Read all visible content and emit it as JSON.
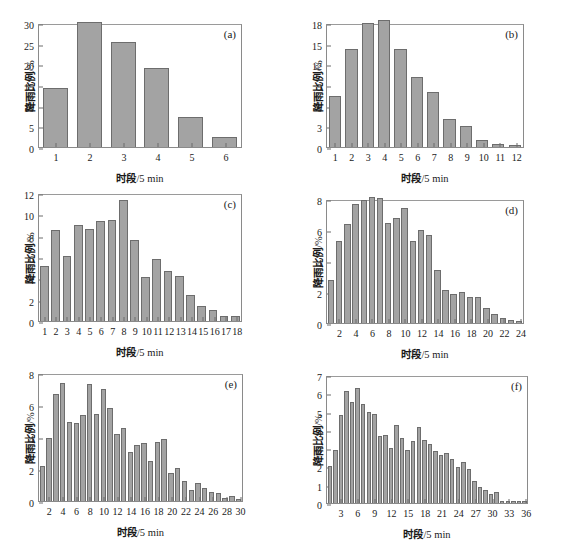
{
  "figure": {
    "bar_fill": "#a3a3a3",
    "bar_stroke": "#6d6d6d",
    "axis_color": "#8a8a8a",
    "background": "#ffffff",
    "ylabel_text": "降雨比例",
    "ylabel_unit": "/%",
    "xlabel_text": "时段",
    "xlabel_unit": "/5 min"
  },
  "chart_data": [
    {
      "type": "bar",
      "panel": "(a)",
      "title": "",
      "xlabel": "时段/5 min",
      "ylabel": "降雨比例/%",
      "ylim": [
        0,
        30
      ],
      "yticks": [
        0,
        5,
        10,
        15,
        20,
        25,
        30
      ],
      "grid": false,
      "categories": [
        "1",
        "2",
        "3",
        "4",
        "5",
        "6"
      ],
      "xtick_labels": [
        "1",
        "2",
        "3",
        "4",
        "5",
        "6"
      ],
      "values": [
        14.3,
        30.3,
        25.4,
        19.0,
        7.3,
        2.5
      ]
    },
    {
      "type": "bar",
      "panel": "(b)",
      "title": "",
      "xlabel": "时段/5 min",
      "ylabel": "降雨比例/%",
      "ylim": [
        0,
        18
      ],
      "yticks": [
        0,
        3,
        6,
        9,
        12,
        15,
        18
      ],
      "grid": false,
      "categories": [
        "1",
        "2",
        "3",
        "4",
        "5",
        "6",
        "7",
        "8",
        "9",
        "10",
        "11",
        "12"
      ],
      "xtick_labels": [
        "1",
        "2",
        "3",
        "4",
        "5",
        "6",
        "7",
        "8",
        "9",
        "10",
        "11",
        "12"
      ],
      "values": [
        7.4,
        14.2,
        18.0,
        18.4,
        14.2,
        10.1,
        8.0,
        4.1,
        3.0,
        1.0,
        0.4,
        0.3
      ]
    },
    {
      "type": "bar",
      "panel": "(c)",
      "title": "",
      "xlabel": "时段/5 min",
      "ylabel": "降雨比例/%",
      "ylim": [
        0,
        12
      ],
      "yticks": [
        0,
        2,
        4,
        6,
        8,
        10,
        12
      ],
      "grid": false,
      "categories": [
        "1",
        "2",
        "3",
        "4",
        "5",
        "6",
        "7",
        "8",
        "9",
        "10",
        "11",
        "12",
        "13",
        "14",
        "15",
        "16",
        "17",
        "18"
      ],
      "xtick_labels": [
        "1",
        "2",
        "3",
        "4",
        "5",
        "6",
        "7",
        "8",
        "9",
        "10",
        "11",
        "12",
        "13",
        "14",
        "15",
        "16",
        "17",
        "18"
      ],
      "values": [
        5.2,
        8.5,
        6.1,
        9.0,
        8.65,
        9.35,
        9.45,
        11.35,
        7.6,
        4.1,
        5.8,
        4.7,
        4.25,
        2.45,
        1.4,
        1.05,
        0.5,
        0.5
      ]
    },
    {
      "type": "bar",
      "panel": "(d)",
      "title": "",
      "xlabel": "时段/5 min",
      "ylabel": "降雨比例/%",
      "ylim": [
        0,
        8
      ],
      "yticks": [
        0,
        2,
        4,
        6,
        8
      ],
      "grid": false,
      "categories": [
        "1",
        "2",
        "3",
        "4",
        "5",
        "6",
        "7",
        "8",
        "9",
        "10",
        "11",
        "12",
        "13",
        "14",
        "15",
        "16",
        "17",
        "18",
        "19",
        "20",
        "21",
        "22",
        "23",
        "24"
      ],
      "xtick_labels": [
        "2",
        "4",
        "6",
        "8",
        "10",
        "12",
        "14",
        "16",
        "18",
        "20",
        "22",
        "24"
      ],
      "xtick_every": 2,
      "values": [
        2.8,
        5.3,
        6.4,
        7.65,
        7.95,
        8.1,
        8.05,
        6.45,
        6.8,
        7.45,
        5.3,
        6.0,
        5.7,
        3.4,
        2.1,
        1.85,
        2.0,
        1.7,
        1.7,
        1.0,
        0.6,
        0.3,
        0.2,
        0.12
      ]
    },
    {
      "type": "bar",
      "panel": "(e)",
      "title": "",
      "xlabel": "时段/5 min",
      "ylabel": "降雨比例/%",
      "ylim": [
        0,
        8
      ],
      "yticks": [
        0,
        2,
        4,
        6,
        8
      ],
      "grid": false,
      "categories": [
        "1",
        "2",
        "3",
        "4",
        "5",
        "6",
        "7",
        "8",
        "9",
        "10",
        "11",
        "12",
        "13",
        "14",
        "15",
        "16",
        "17",
        "18",
        "19",
        "20",
        "21",
        "22",
        "23",
        "24",
        "25",
        "26",
        "27",
        "28",
        "29",
        "30"
      ],
      "xtick_labels": [
        "2",
        "4",
        "6",
        "8",
        "10",
        "12",
        "14",
        "16",
        "18",
        "20",
        "22",
        "24",
        "26",
        "28",
        "30"
      ],
      "xtick_every": 2,
      "values": [
        2.2,
        3.95,
        6.7,
        7.4,
        4.95,
        4.85,
        5.35,
        7.3,
        5.45,
        7.0,
        5.8,
        4.2,
        4.55,
        3.05,
        3.5,
        3.62,
        2.48,
        3.68,
        3.9,
        1.75,
        2.05,
        1.25,
        0.7,
        1.15,
        0.8,
        0.55,
        0.48,
        0.18,
        0.3,
        0.15
      ]
    },
    {
      "type": "bar",
      "panel": "(f)",
      "title": "",
      "xlabel": "时段/5 min",
      "ylabel": "降雨比例/%",
      "ylim": [
        0,
        7
      ],
      "yticks": [
        0,
        1,
        2,
        3,
        4,
        5,
        6,
        7
      ],
      "grid": false,
      "categories": [
        "1",
        "2",
        "3",
        "4",
        "5",
        "6",
        "7",
        "8",
        "9",
        "10",
        "11",
        "12",
        "13",
        "14",
        "15",
        "16",
        "17",
        "18",
        "19",
        "20",
        "21",
        "22",
        "23",
        "24",
        "25",
        "26",
        "27",
        "28",
        "29",
        "30",
        "31",
        "32",
        "33",
        "34",
        "35",
        "36"
      ],
      "xtick_labels": [
        "3",
        "6",
        "9",
        "12",
        "15",
        "18",
        "21",
        "24",
        "27",
        "30",
        "33",
        "36"
      ],
      "xtick_every": 3,
      "values": [
        2.02,
        2.9,
        4.82,
        6.15,
        5.52,
        6.28,
        5.42,
        5.0,
        4.85,
        3.68,
        3.72,
        3.0,
        4.25,
        3.58,
        2.9,
        3.4,
        4.15,
        3.42,
        3.25,
        2.85,
        2.62,
        2.72,
        2.4,
        1.98,
        2.22,
        1.85,
        1.18,
        0.9,
        0.7,
        0.5,
        0.58,
        0.12,
        0.1,
        0.12,
        0.1,
        0.1
      ]
    }
  ]
}
